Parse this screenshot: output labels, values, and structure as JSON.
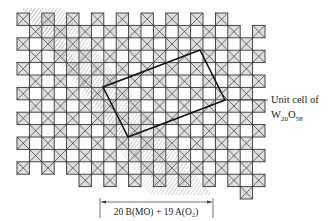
{
  "figure": {
    "type": "crystal-structure-diagram",
    "labels": {
      "unit_cell_line1": "Unit cell of",
      "unit_cell_formula_main": "W",
      "unit_cell_sub1": "20",
      "unit_cell_formula_o": "O",
      "unit_cell_sub2": "58",
      "band_label_prefix": "20 B(MO) + 19 A(O",
      "band_label_sub": "2",
      "band_label_suffix": ")"
    },
    "elements": {
      "octahedra": "WO6 octahedra drawn as squares with crossed diagonals",
      "shear_band": "hatched diagonal band (crystallographic shear region)",
      "unit_cell": "tilted rectangle outline",
      "dimension_arrow": "double-headed arrow spanning the shear band width"
    },
    "colors": {
      "line": "#333333",
      "octahedron_fill": "#e0e0e0",
      "hatch": "#8a8a8a",
      "unit_cell": "#111111"
    }
  }
}
